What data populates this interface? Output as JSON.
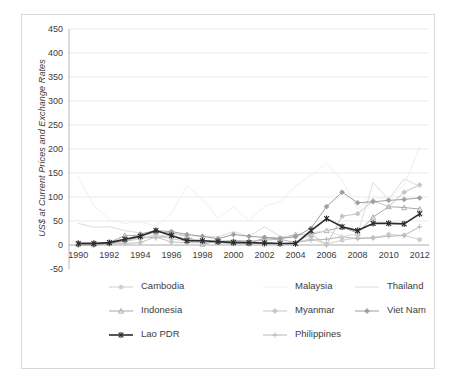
{
  "chart_data": {
    "type": "line",
    "title": "",
    "xlabel": "",
    "ylabel": "US$ at Current Prices and Exchange Rates",
    "xlim": [
      1989.4,
      2012.6
    ],
    "ylim": [
      -50,
      450
    ],
    "ytick_labels": [
      "450",
      "400",
      "350",
      "300",
      "250",
      "200",
      "150",
      "100",
      "50",
      "0",
      "-50"
    ],
    "ytick_values": [
      450,
      400,
      350,
      300,
      250,
      200,
      150,
      100,
      50,
      0,
      -50
    ],
    "xtick_labels": [
      "1990",
      "1992",
      "1994",
      "1996",
      "1998",
      "2000",
      "2002",
      "2004",
      "2006",
      "2008",
      "2010",
      "2012"
    ],
    "xtick_values": [
      1990,
      1992,
      1994,
      1996,
      1998,
      2000,
      2002,
      2004,
      2006,
      2008,
      2010,
      2012
    ],
    "x": [
      1990,
      1991,
      1992,
      1993,
      1994,
      1995,
      1996,
      1997,
      1998,
      1999,
      2000,
      2001,
      2002,
      2003,
      2004,
      2005,
      2006,
      2007,
      2008,
      2009,
      2010,
      2011,
      2012
    ],
    "grid": true,
    "legend_position": "bottom",
    "series": [
      {
        "name": "Cambodia",
        "color": "#cfcfcf",
        "marker": "circle",
        "line_width": 1.0,
        "values": [
          0,
          0,
          2,
          7,
          13,
          20,
          13,
          8,
          6,
          5,
          2,
          2,
          0,
          2,
          5,
          13,
          2,
          10,
          15,
          15,
          22,
          20,
          11
        ]
      },
      {
        "name": "Indonesia",
        "color": "#a8a8a8",
        "marker": "triangle",
        "line_width": 1.0,
        "values": [
          2,
          2,
          5,
          20,
          20,
          27,
          25,
          18,
          2,
          8,
          8,
          3,
          15,
          13,
          22,
          22,
          30,
          37,
          25,
          58,
          80,
          78,
          75
        ]
      },
      {
        "name": "Lao PDR",
        "color": "#2b2b2b",
        "marker": "star",
        "line_width": 1.6,
        "values": [
          3,
          3,
          5,
          12,
          18,
          30,
          20,
          9,
          9,
          7,
          5,
          5,
          4,
          3,
          3,
          30,
          55,
          38,
          30,
          45,
          45,
          44,
          65
        ]
      },
      {
        "name": "Malaysia",
        "color": "#efefef",
        "marker": "none",
        "line_width": 1.0,
        "values": [
          142,
          82,
          53,
          45,
          48,
          40,
          65,
          123,
          95,
          55,
          80,
          50,
          80,
          90,
          123,
          145,
          170,
          135,
          75,
          100,
          95,
          125,
          205
        ]
      },
      {
        "name": "Myanmar",
        "color": "#c4c4c4",
        "marker": "diamond",
        "line_width": 1.0,
        "values": [
          5,
          5,
          2,
          3,
          5,
          17,
          6,
          5,
          5,
          8,
          8,
          6,
          5,
          3,
          5,
          23,
          0,
          60,
          65,
          92,
          80,
          110,
          125
        ]
      },
      {
        "name": "Philippines",
        "color": "#b8b8b8",
        "marker": "plus",
        "line_width": 1.0,
        "values": [
          5,
          5,
          5,
          8,
          17,
          15,
          20,
          12,
          10,
          5,
          10,
          8,
          10,
          12,
          5,
          10,
          12,
          17,
          13,
          15,
          18,
          20,
          38
        ]
      },
      {
        "name": "Thailand",
        "color": "#dcdcdc",
        "marker": "none",
        "line_width": 1.0,
        "values": [
          45,
          37,
          38,
          30,
          25,
          18,
          23,
          20,
          18,
          17,
          28,
          18,
          38,
          18,
          18,
          25,
          30,
          18,
          23,
          130,
          95,
          138,
          122
        ]
      },
      {
        "name": "Viet Nam",
        "color": "#9e9e9e",
        "marker": "diamond",
        "line_width": 1.0,
        "values": [
          0,
          0,
          3,
          10,
          23,
          30,
          28,
          22,
          18,
          13,
          22,
          18,
          16,
          14,
          17,
          35,
          80,
          110,
          88,
          90,
          93,
          95,
          98
        ]
      }
    ]
  },
  "legend": {
    "rows": [
      [
        {
          "label": "Cambodia",
          "series": "Cambodia"
        },
        {
          "label": "Malaysia",
          "series": "Malaysia"
        },
        {
          "label": "Thailand",
          "series": "Thailand"
        }
      ],
      [
        {
          "label": "Indonesia",
          "series": "Indonesia"
        },
        {
          "label": "Myanmar",
          "series": "Myanmar"
        },
        {
          "label": "Viet Nam",
          "series": "Viet Nam"
        }
      ],
      [
        {
          "label": "Lao PDR",
          "series": "Lao PDR"
        },
        {
          "label": "Philippines",
          "series": "Philippines"
        }
      ]
    ]
  }
}
